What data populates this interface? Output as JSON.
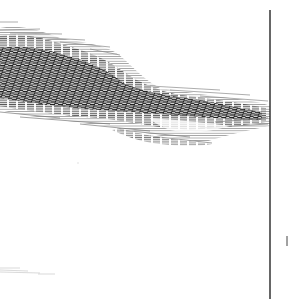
{
  "image": {
    "width": 289,
    "height": 299,
    "background": "#ffffff",
    "ink": "#1a1a1a",
    "ink_mid": "#555555",
    "ink_light": "#9a9a9a"
  },
  "elements": {
    "hatched_mass": {
      "description": "dark engraved hatched band (cloud/landscape mass)",
      "outer_path": "M0,28 C20,24 40,30 60,38 C80,42 100,44 115,52 C130,62 140,78 160,88 C185,92 215,96 245,100 C258,102 266,104 270,106 L270,126 C250,130 230,134 205,142 C180,140 150,134 120,128 C90,124 60,120 30,116 C18,114 8,112 0,110 Z",
      "core_path": "M0,48 C25,44 50,50 75,58 C95,64 110,72 125,84 C145,92 170,96 200,100 C220,104 240,108 262,112 L262,120 C240,120 215,118 190,116 C160,114 130,112 100,110 C70,108 40,104 0,98 Z",
      "tail_path": "M120,128 C140,134 160,138 180,140 C195,142 205,143 212,144 C200,146 180,146 160,144 C140,142 125,136 112,130 Z"
    },
    "vertical_rule": {
      "x": 270,
      "y1": 10,
      "y2": 299,
      "color": "#333333",
      "width": 1.5
    },
    "right_tick": {
      "x": 287,
      "y1": 236,
      "y2": 246,
      "color": "#444444"
    },
    "bottom_smudge": {
      "x": 0,
      "y": 268,
      "width": 55,
      "height": 6,
      "color": "#cfcfcf"
    },
    "mid_speck": {
      "x": 78,
      "y": 163,
      "color": "#dddddd"
    }
  }
}
